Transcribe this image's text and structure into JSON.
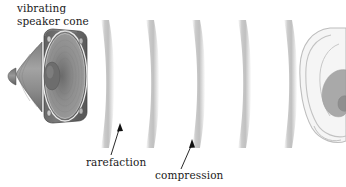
{
  "figure": {
    "width": 346,
    "height": 187,
    "background": "#ffffff",
    "type": "physics-illustration"
  },
  "labels": {
    "speaker": "vibrating\nspeaker cone",
    "speaker_line1": "vibrating",
    "speaker_line2": "speaker cone",
    "rarefaction": "rarefaction",
    "compression": "compression"
  },
  "speaker": {
    "name": "vibrating speaker cone",
    "faceplate_fill": "#6e6e6e",
    "cone_fill": "#8e8e8e",
    "rim_stroke": "#efefef",
    "magnet_fill": "#8a8a8a",
    "screw_count": 4
  },
  "waves": {
    "count": 5,
    "color": "#c9c9c9",
    "x_positions": [
      101,
      146,
      196,
      242,
      288
    ],
    "top": 22,
    "bottom": 146,
    "band_width": 8
  },
  "ear": {
    "name": "ear",
    "outline_stroke": "#b8b8b8",
    "skin_fill": "#f4f4f4",
    "concha_fill": "#a8a8a8",
    "x": 300,
    "y": 28,
    "width": 46,
    "height": 112
  },
  "arrows": {
    "rarefaction": {
      "from_x": 111,
      "from_y": 154,
      "to_x": 119,
      "to_y": 124,
      "color": "#111111"
    },
    "compression": {
      "from_x": 181,
      "from_y": 168,
      "to_x": 192,
      "to_y": 140,
      "color": "#111111"
    }
  }
}
